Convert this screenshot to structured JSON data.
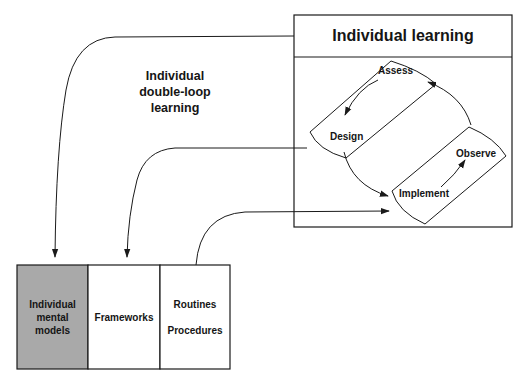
{
  "diagram": {
    "individual_learning_box": {
      "title": "Individual learning",
      "cycle": {
        "assess": "Assess",
        "design": "Design",
        "implement": "Implement",
        "observe": "Observe"
      }
    },
    "loop_label": {
      "line1": "Individual",
      "line2": "double-loop",
      "line3": "learning"
    },
    "memory_boxes": [
      {
        "line1": "Individual",
        "line2": "mental",
        "line3": "models",
        "fill": "#a9a9a9"
      },
      {
        "label": "Frameworks",
        "fill": "#ffffff"
      },
      {
        "line1": "Routines",
        "line2": "Procedures",
        "fill": "#ffffff"
      }
    ],
    "colors": {
      "stroke": "#1a1a1a",
      "shaded": "#a9a9a9"
    }
  }
}
